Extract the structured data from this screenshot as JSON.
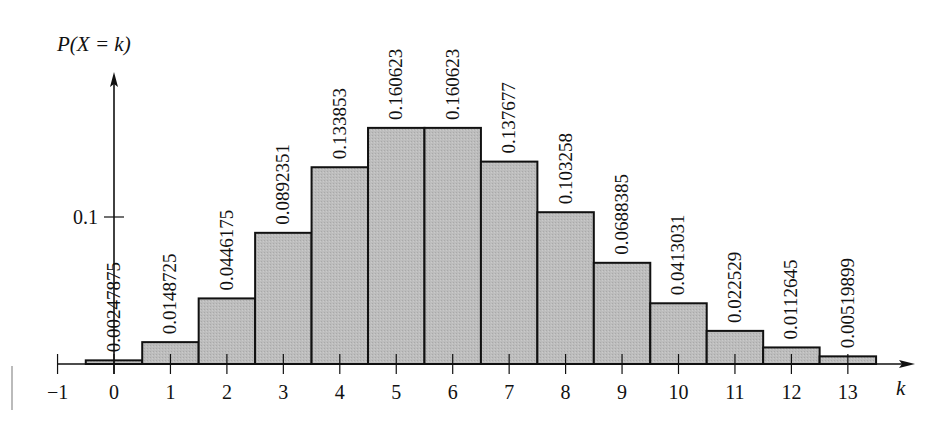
{
  "chart_data": {
    "type": "bar",
    "title": "",
    "xlabel": "k",
    "ylabel": "P(X = k)",
    "categories": [
      0,
      1,
      2,
      3,
      4,
      5,
      6,
      7,
      8,
      9,
      10,
      11,
      12,
      13
    ],
    "values": [
      0.00247875,
      0.0148725,
      0.0446175,
      0.0892351,
      0.133853,
      0.160623,
      0.160623,
      0.137677,
      0.103258,
      0.0688385,
      0.0413031,
      0.022529,
      0.0112645,
      0.00519899
    ],
    "value_labels": [
      "0.00247875",
      "0.0148725",
      "0.0446175",
      "0.0892351",
      "0.133853",
      "0.160623",
      "0.160623",
      "0.137677",
      "0.103258",
      "0.0688385",
      "0.0413031",
      "0.022529",
      "0.0112645",
      "0.00519899"
    ],
    "x_ticks": [
      "−1",
      "0",
      "1",
      "2",
      "3",
      "4",
      "5",
      "6",
      "7",
      "8",
      "9",
      "10",
      "11",
      "12",
      "13"
    ],
    "y_ticks": [
      {
        "value": 0.1,
        "label": "0.1"
      }
    ],
    "xlim": [
      -1,
      13.6
    ],
    "ylim": [
      0,
      0.16
    ],
    "grid": false,
    "legend": null,
    "bar_fill": "#b8b8b8",
    "bar_stroke": "#111111",
    "bar_width": 1.0
  }
}
